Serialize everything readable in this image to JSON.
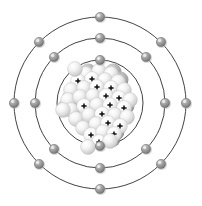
{
  "diagram": {
    "kind": "atomic-structure",
    "background_color": "#ffffff",
    "center": {
      "x": 100,
      "y": 103
    },
    "ring_color": "#2e2e2e",
    "ring_stroke_width": 0.9,
    "electron_color": "#8c8c8c",
    "electron_highlight": "#d8d8d8",
    "electron_shadow": "#5a5a5a",
    "electron_radius": 4.6,
    "proton_mark_color": "#0d0d0d",
    "nucleon_gray": "#a8a8a8",
    "nucleon_gray_dark": "#7d7d7d",
    "nucleon_white": "#f2f2f2",
    "nucleon_white_edge": "#c9c9c9",
    "shells": [
      {
        "name": "shell-1",
        "label": "K",
        "radius": 43,
        "electron_count": 2
      },
      {
        "name": "shell-2",
        "label": "L",
        "radius": 65,
        "electron_count": 8
      },
      {
        "name": "shell-3",
        "label": "M",
        "radius": 86,
        "electron_count": 8
      }
    ],
    "total_electrons": 18,
    "electrons": [
      {
        "shell": 1,
        "x": 100,
        "y": 60
      },
      {
        "shell": 1,
        "x": 100,
        "y": 146
      },
      {
        "shell": 2,
        "x": 100,
        "y": 38
      },
      {
        "shell": 2,
        "x": 146,
        "y": 57
      },
      {
        "shell": 2,
        "x": 165,
        "y": 103
      },
      {
        "shell": 2,
        "x": 146,
        "y": 149
      },
      {
        "shell": 2,
        "x": 100,
        "y": 168
      },
      {
        "shell": 2,
        "x": 54,
        "y": 149
      },
      {
        "shell": 2,
        "x": 35,
        "y": 103
      },
      {
        "shell": 2,
        "x": 54,
        "y": 57
      },
      {
        "shell": 3,
        "x": 100,
        "y": 17
      },
      {
        "shell": 3,
        "x": 161,
        "y": 42
      },
      {
        "shell": 3,
        "x": 186,
        "y": 103
      },
      {
        "shell": 3,
        "x": 161,
        "y": 164
      },
      {
        "shell": 3,
        "x": 100,
        "y": 189
      },
      {
        "shell": 3,
        "x": 39,
        "y": 164
      },
      {
        "shell": 3,
        "x": 14,
        "y": 103
      },
      {
        "shell": 3,
        "x": 39,
        "y": 42
      }
    ],
    "nucleus": {
      "name": "nucleus",
      "center_x": 100,
      "center_y": 101,
      "radius_extent": 32,
      "nucleon_radius": 7.4,
      "proton_count": 18,
      "neutron_count": 22,
      "nucleons": [
        {
          "x": 86,
          "y": 74,
          "type": "neutron"
        },
        {
          "x": 99,
          "y": 71,
          "type": "neutron"
        },
        {
          "x": 111,
          "y": 74,
          "type": "neutron"
        },
        {
          "x": 78,
          "y": 81,
          "type": "proton"
        },
        {
          "x": 92,
          "y": 79,
          "type": "proton"
        },
        {
          "x": 105,
          "y": 80,
          "type": "neutron"
        },
        {
          "x": 118,
          "y": 82,
          "type": "neutron"
        },
        {
          "x": 71,
          "y": 90,
          "type": "neutron"
        },
        {
          "x": 84,
          "y": 88,
          "type": "neutron"
        },
        {
          "x": 97,
          "y": 87,
          "type": "proton"
        },
        {
          "x": 111,
          "y": 88,
          "type": "proton"
        },
        {
          "x": 124,
          "y": 90,
          "type": "neutron"
        },
        {
          "x": 68,
          "y": 100,
          "type": "neutron"
        },
        {
          "x": 80,
          "y": 97,
          "type": "neutron"
        },
        {
          "x": 93,
          "y": 96,
          "type": "neutron"
        },
        {
          "x": 106,
          "y": 96,
          "type": "proton"
        },
        {
          "x": 119,
          "y": 98,
          "type": "proton"
        },
        {
          "x": 130,
          "y": 100,
          "type": "neutron"
        },
        {
          "x": 71,
          "y": 110,
          "type": "neutron"
        },
        {
          "x": 84,
          "y": 106,
          "type": "proton"
        },
        {
          "x": 97,
          "y": 105,
          "type": "neutron"
        },
        {
          "x": 110,
          "y": 105,
          "type": "proton"
        },
        {
          "x": 124,
          "y": 108,
          "type": "proton"
        },
        {
          "x": 76,
          "y": 119,
          "type": "neutron"
        },
        {
          "x": 89,
          "y": 115,
          "type": "neutron"
        },
        {
          "x": 102,
          "y": 114,
          "type": "proton"
        },
        {
          "x": 115,
          "y": 115,
          "type": "neutron"
        },
        {
          "x": 127,
          "y": 117,
          "type": "neutron"
        },
        {
          "x": 83,
          "y": 128,
          "type": "neutron"
        },
        {
          "x": 96,
          "y": 124,
          "type": "neutron"
        },
        {
          "x": 108,
          "y": 123,
          "type": "proton"
        },
        {
          "x": 120,
          "y": 126,
          "type": "proton"
        },
        {
          "x": 91,
          "y": 135,
          "type": "proton"
        },
        {
          "x": 103,
          "y": 132,
          "type": "neutron"
        },
        {
          "x": 114,
          "y": 134,
          "type": "proton"
        },
        {
          "x": 99,
          "y": 142,
          "type": "proton"
        },
        {
          "x": 110,
          "y": 141,
          "type": "neutron"
        },
        {
          "x": 75,
          "y": 69,
          "type": "neutron"
        },
        {
          "x": 63,
          "y": 110,
          "type": "neutron"
        },
        {
          "x": 88,
          "y": 147,
          "type": "neutron"
        }
      ]
    }
  }
}
